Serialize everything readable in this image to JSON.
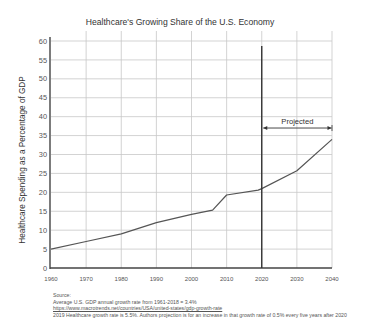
{
  "chart_data": {
    "type": "line",
    "title": "Healthcare's Growing Share of the U.S. Economy",
    "xlabel": "",
    "ylabel": "Healthcare Spending as a Percentage of GDP",
    "xlim": [
      1960,
      2040
    ],
    "ylim": [
      0,
      60
    ],
    "x_ticks": [
      1960,
      1970,
      1980,
      1990,
      2000,
      2010,
      2020,
      2030,
      2040
    ],
    "y_ticks": [
      0,
      5,
      10,
      15,
      20,
      25,
      30,
      35,
      40,
      45,
      50,
      55,
      60
    ],
    "grid": true,
    "series": [
      {
        "name": "Healthcare spending % of GDP",
        "x": [
          1960,
          1970,
          1980,
          1990,
          2000,
          2006,
          2010,
          2019,
          2020,
          2030,
          2040
        ],
        "values": [
          5,
          7,
          9,
          12,
          14.2,
          15.3,
          19.3,
          20.6,
          21,
          25.7,
          34
        ]
      }
    ],
    "annotations": [
      {
        "type": "vertical-line",
        "x": 2020
      },
      {
        "type": "range-arrow",
        "x_start": 2020,
        "x_end": 2040,
        "y": 37,
        "label": "Projected"
      }
    ]
  },
  "source": {
    "heading": "Source:",
    "lines": [
      "Average U.S. GDP annual growth rate from 1961-2018 = 3.4%",
      "https://www.macrotrends.net/countries/USA/united-states/gdp-growth-rate",
      "2019 Healthcare growth rate is 5.5%. Authors projection is for an increase in that growth rate of 0.5% every five years after 2020"
    ]
  }
}
